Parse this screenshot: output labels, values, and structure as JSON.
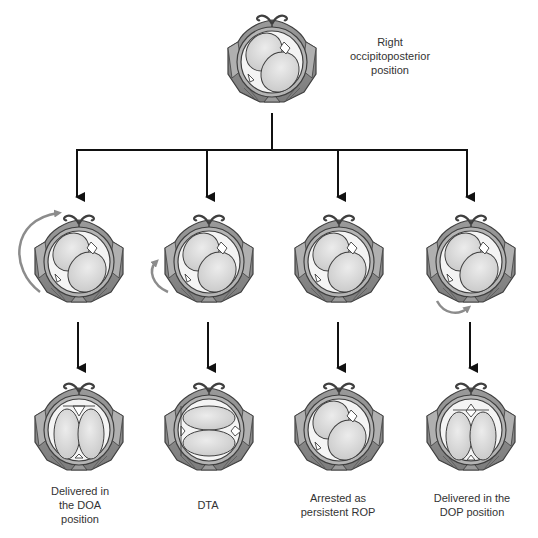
{
  "diagram": {
    "top": {
      "label_lines": [
        "Right",
        "occipitoposterior",
        "position"
      ],
      "head_position": "ROP"
    },
    "middle_row": [
      {
        "head_position": "ROP",
        "rotation": "long-anterior-rotation",
        "rotation_arrow": "large curved arrow on left side, pointing up to the top"
      },
      {
        "head_position": "ROP",
        "rotation": "short-anterior-rotation",
        "rotation_arrow": "small curved arrow on lower left, pointing up"
      },
      {
        "head_position": "ROP",
        "rotation": "none",
        "rotation_arrow": ""
      },
      {
        "head_position": "ROP",
        "rotation": "posterior-rotation",
        "rotation_arrow": "small curved arrow at bottom, pointing right"
      }
    ],
    "bottom_row": [
      {
        "head_position": "DOA",
        "label_lines": [
          "Delivered in",
          "the DOA",
          "position"
        ]
      },
      {
        "head_position": "DTA",
        "label_lines": [
          "DTA"
        ]
      },
      {
        "head_position": "ROP",
        "label_lines": [
          "Arrested as",
          "persistent ROP"
        ]
      },
      {
        "head_position": "DOP",
        "label_lines": [
          "Delivered in the",
          "DOP position"
        ]
      }
    ],
    "colors": {
      "pelvis_outer": "#8a8a8a",
      "pelvis_mid": "#a9a9a9",
      "head_fill": "#d9d9d9",
      "outline": "#3f3f3f",
      "arrow": "#111111",
      "rotation_arrow": "#8c8c8c"
    }
  }
}
